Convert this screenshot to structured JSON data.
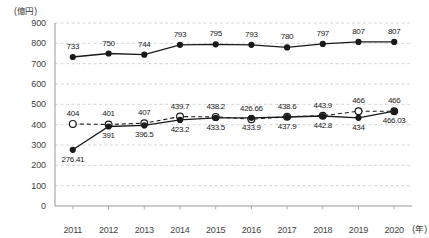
{
  "chart_data": {
    "type": "line",
    "title": "",
    "subtitle": "",
    "ylabel": "(億円)",
    "xlabel": "(年)",
    "categories": [
      "2011",
      "2012",
      "2013",
      "2014",
      "2015",
      "2016",
      "2017",
      "2018",
      "2019",
      "2020"
    ],
    "ylim": [
      0,
      900
    ],
    "yticks": [
      "0",
      "100",
      "200",
      "300",
      "400",
      "500",
      "600",
      "700",
      "800",
      "900"
    ],
    "ytick_values": [
      0,
      100,
      200,
      300,
      400,
      500,
      600,
      700,
      800,
      900
    ],
    "grid": true,
    "grid_style": "dashed",
    "legend": "none",
    "series": [
      {
        "name": "upper-solid-filled",
        "marker": "filled-circle",
        "line": "solid",
        "color": "#1a1a1a",
        "values": [
          733,
          750,
          744,
          793,
          795,
          793,
          780,
          797,
          807,
          807
        ],
        "labels": [
          "733",
          "750",
          "744",
          "793",
          "795",
          "793",
          "780",
          "797",
          "807",
          "807"
        ],
        "label_position": "above"
      },
      {
        "name": "lower-dashed-open",
        "marker": "open-circle",
        "line": "dashed",
        "color": "#1a1a1a",
        "values": [
          404,
          401,
          407,
          439.7,
          438.2,
          426.66,
          438.6,
          443.9,
          466,
          466
        ],
        "labels": [
          "404",
          "401",
          "407",
          "439.7",
          "438.2",
          "426.66",
          "438.6",
          "443.9",
          "466",
          "466"
        ],
        "label_position": "above"
      },
      {
        "name": "lower-solid-filled",
        "marker": "filled-circle",
        "line": "solid",
        "color": "#1a1a1a",
        "values": [
          276.41,
          391,
          396.5,
          423.2,
          433.5,
          433.9,
          437.9,
          442.8,
          434,
          466.03
        ],
        "labels": [
          "276.41",
          "391",
          "396.5",
          "423.2",
          "433.5",
          "433.9",
          "437.9",
          "442.8",
          "434",
          "466.03"
        ],
        "label_position": "below"
      }
    ]
  }
}
